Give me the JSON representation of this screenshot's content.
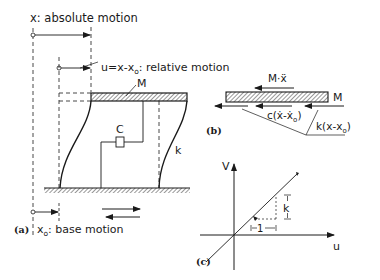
{
  "figure": {
    "panel_a": {
      "tag": "(a)",
      "absolute_motion_label": "x: absolute motion",
      "relative_motion_label": "u=x-x",
      "relative_motion_sub": "o",
      "relative_motion_suffix": ": relative motion",
      "base_motion_label": "x",
      "base_motion_sub": "o",
      "base_motion_suffix": ": base motion",
      "mass_label": "M",
      "damper_label": "C",
      "spring_label": "k"
    },
    "panel_b": {
      "tag": "(b)",
      "mass_label": "M",
      "inertia_label": "M·ẍ",
      "damping_force_label": "c(ẋ-ẋ",
      "damping_force_sub": "o",
      "damping_force_close": ")",
      "spring_force_label": "k(x-x",
      "spring_force_sub": "o",
      "spring_force_close": ")"
    },
    "panel_c": {
      "tag": "(c)",
      "y_axis_label": "V",
      "x_axis_label": "u",
      "slope_label": "k",
      "run_label": "1"
    },
    "colors": {
      "ink": "#1a1a1a",
      "background": "#ffffff"
    }
  }
}
